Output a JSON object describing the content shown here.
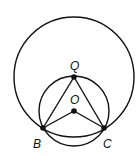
{
  "diagram": {
    "labels": {
      "Q": "Q",
      "O": "O",
      "B": "B",
      "C": "C"
    },
    "points": {
      "Q": [
        74,
        77
      ],
      "O": [
        74,
        111
      ],
      "B": [
        43,
        128
      ],
      "C": [
        104,
        128
      ]
    },
    "circles": [
      {
        "name": "large-circle",
        "center": "Q",
        "radius": 60
      },
      {
        "name": "small-circle",
        "center": "O",
        "radius": 35
      }
    ],
    "segments": [
      [
        "Q",
        "B"
      ],
      [
        "Q",
        "C"
      ],
      [
        "O",
        "B"
      ],
      [
        "O",
        "C"
      ],
      [
        "B",
        "C"
      ]
    ],
    "colors": {
      "stroke": "#111111",
      "background": "#ffffff"
    }
  }
}
